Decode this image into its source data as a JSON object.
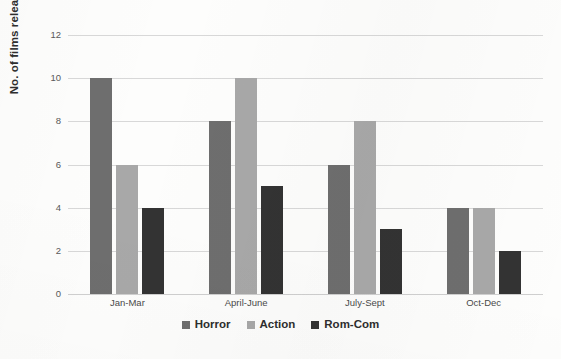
{
  "chart_data": {
    "type": "bar",
    "title": "",
    "xlabel": "",
    "ylabel": "No. of films released",
    "ylim": [
      0,
      12
    ],
    "ytick_step": 2,
    "yticks": [
      0,
      2,
      4,
      6,
      8,
      10,
      12
    ],
    "grid": "horizontal",
    "legend_position": "bottom-center",
    "categories": [
      "Jan-Mar",
      "April-June",
      "July-Sept",
      "Oct-Dec"
    ],
    "series": [
      {
        "name": "Horror",
        "color": "#6e6e6e",
        "values": [
          10,
          8,
          6,
          4
        ]
      },
      {
        "name": "Action",
        "color": "#a8a8a8",
        "values": [
          6,
          10,
          8,
          4
        ]
      },
      {
        "name": "Rom-Com",
        "color": "#333333",
        "values": [
          4,
          5,
          3,
          2
        ]
      }
    ]
  },
  "axis": {
    "y_title": "No. of films released"
  },
  "colors": {
    "gridline": "#d8d8d8",
    "baseline": "#cfcfcf",
    "background": "#fdfdfc",
    "tick_text": "#595959",
    "label_text": "#2e2e2e"
  }
}
